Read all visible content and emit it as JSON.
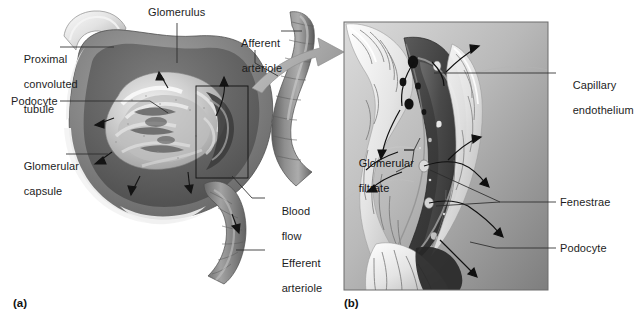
{
  "figure": {
    "background_color": "#ffffff",
    "width": 628,
    "height": 323
  },
  "panels": [
    {
      "id": "a",
      "caption": "(a)",
      "description": "Cutaway view of a renal corpuscle showing the glomerulus within the glomerular capsule, with afferent and efferent arterioles.",
      "style": "grayscale airbrush anatomical illustration"
    },
    {
      "id": "b",
      "caption": "(b)",
      "description": "Magnified view of a single glomerular capillary wrapped by podocytes, showing fenestrae and the filtration pathway.",
      "style": "grayscale airbrush anatomical illustration with gradient background"
    }
  ],
  "labels_panel_a": [
    {
      "name": "glomerulus",
      "lines": [
        "Glomerulus"
      ],
      "x": 148,
      "y": 8,
      "align": "left"
    },
    {
      "name": "afferent-arteriole",
      "lines": [
        "Afferent",
        "arteriole"
      ],
      "x": 229,
      "y": 26,
      "align": "left"
    },
    {
      "name": "proximal-convoluted-tubule",
      "lines": [
        "Proximal",
        "convoluted",
        "tubule"
      ],
      "x": 11,
      "y": 41,
      "align": "left"
    },
    {
      "name": "podocyte",
      "lines": [
        "Podocyte"
      ],
      "x": 11,
      "y": 96,
      "align": "left"
    },
    {
      "name": "glomerular-capsule",
      "lines": [
        "Glomerular",
        "capsule"
      ],
      "x": 11,
      "y": 148,
      "align": "left"
    },
    {
      "name": "blood-flow",
      "lines": [
        "Blood",
        "flow"
      ],
      "x": 269,
      "y": 193,
      "align": "left"
    },
    {
      "name": "efferent-arteriole",
      "lines": [
        "Efferent",
        "arteriole"
      ],
      "x": 269,
      "y": 245,
      "align": "left"
    }
  ],
  "labels_panel_b": [
    {
      "name": "capillary-endothelium",
      "lines": [
        "Capillary",
        "endothelium"
      ],
      "x": 560,
      "y": 66,
      "align": "left"
    },
    {
      "name": "glomerular-filtrate",
      "lines": [
        "Glomerular",
        "filtrate"
      ],
      "x": 346,
      "y": 144,
      "align": "left"
    },
    {
      "name": "fenestrae",
      "lines": [
        "Fenestrae"
      ],
      "x": 560,
      "y": 196,
      "align": "left"
    },
    {
      "name": "podocyte",
      "lines": [
        "Podocyte"
      ],
      "x": 560,
      "y": 242,
      "align": "left"
    }
  ],
  "colors": {
    "text": "#1d1d1d",
    "leader_line": "#2a2a2a",
    "inset_box": "#111111",
    "panel_frame": "#6d6d6d",
    "zoom_arrow": "#a8a8a8",
    "capsule_dark": "#6b6b6b",
    "capsule_mid": "#8f8f8f",
    "tuft_light": "#d9d9d9",
    "arteriole": "#7a7a7a",
    "capillary_dark": "#4a4a4a",
    "fenestra": "#1c1c1c",
    "podocyte_light": "#ececec",
    "panel_b_bg_light": "#d2d2d2",
    "panel_b_bg_dark": "#8a8a8a"
  },
  "annotations": {
    "zoom_arrow": {
      "name": "magnification-arrow",
      "from_panel": "a",
      "to_panel": "b"
    },
    "inset_box": {
      "name": "magnified-region-box",
      "panel": "a"
    },
    "flow_arrows": {
      "name": "filtration-flow-arrows",
      "count": 12
    }
  }
}
